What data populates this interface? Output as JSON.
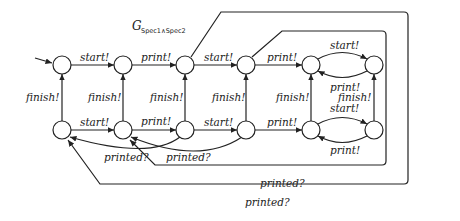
{
  "diagram": {
    "title": "G",
    "title_subscript": "Spec1∧Spec2",
    "labels": {
      "top_start_1": "start!",
      "top_print_1": "print!",
      "top_start_2": "start!",
      "top_print_2": "print!",
      "right_top_start": "start!",
      "right_top_print": "print!",
      "finish_1": "finish!",
      "finish_2": "finish!",
      "finish_3": "finish!",
      "finish_4": "finish!",
      "finish_5": "finish!",
      "finish_6": "finish!",
      "bottom_start_1": "start!",
      "bottom_print_1": "print!",
      "bottom_start_2": "start!",
      "bottom_print_2": "print!",
      "right_bottom_start": "start!",
      "right_bottom_print": "print!",
      "printed_1": "printed?",
      "printed_2": "printed?",
      "printed_inner_box": "printed?",
      "printed_outer_box": "printed?"
    }
  }
}
